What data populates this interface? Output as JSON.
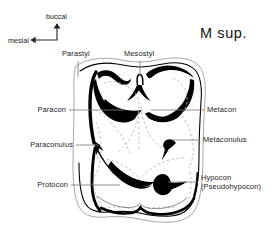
{
  "figure": {
    "title": "M sup."
  },
  "compass": {
    "up_label": "buccal",
    "left_label": "mesial"
  },
  "labels": {
    "parastyl": "Parastyl",
    "mesostyl": "Mesostyl",
    "paracon": "Paracon",
    "metacon": "Metacon",
    "paraconulus": "Paraconulus",
    "metaconulus": "Metaconulus",
    "protocon": "Protocon",
    "hypocon": "Hypocon",
    "hypocon_alt": "(Pseudohypocon)"
  },
  "colors": {
    "ink": "#000000",
    "outline_light": "#9a9a9a",
    "dashed": "#b0b0b0",
    "leader": "#7d7d7d",
    "background": "#ffffff"
  }
}
